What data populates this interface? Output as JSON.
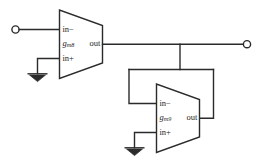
{
  "diagram": {
    "background_color": "#ffffff",
    "line_color": "#2b2b2b"
  },
  "amplifiers": [
    {
      "id": "gm8",
      "gain_prefix": "g",
      "gain_subscript": "m8",
      "pin_inverting": "in−",
      "pin_noninverting": "in+",
      "pin_output": "out"
    },
    {
      "id": "gm9",
      "gain_prefix": "g",
      "gain_subscript": "m9",
      "pin_inverting": "in−",
      "pin_noninverting": "in+",
      "pin_output": "out"
    }
  ],
  "terminals": [
    {
      "id": "input-terminal",
      "type": "open-circle"
    },
    {
      "id": "output-terminal",
      "type": "open-circle"
    }
  ],
  "grounds": [
    {
      "id": "ground-gm8",
      "symbol": "ground-icon"
    },
    {
      "id": "ground-gm9",
      "symbol": "ground-icon"
    }
  ]
}
